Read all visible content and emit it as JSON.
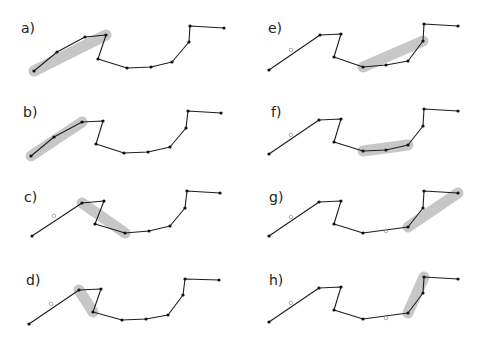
{
  "figure": {
    "width": 484,
    "height": 338,
    "highlight_color": "#c4c4c4",
    "line_color": "#1e1e1e",
    "panels": [
      {
        "label": "a)",
        "label_pos": [
          21,
          20
        ],
        "points": [
          [
            34,
            71
          ],
          [
            57,
            52
          ],
          [
            85,
            37
          ],
          [
            106,
            35
          ],
          [
            98,
            59
          ],
          [
            127,
            68
          ],
          [
            151,
            67
          ],
          [
            172,
            62
          ],
          [
            189,
            42
          ],
          [
            190,
            26
          ],
          [
            224,
            28
          ]
        ],
        "highlight": [
          [
            34,
            71
          ],
          [
            106,
            35
          ]
        ],
        "highlight_width": 11,
        "rings": []
      },
      {
        "label": "b)",
        "label_pos": [
          23,
          104
        ],
        "points": [
          [
            31,
            156
          ],
          [
            54,
            137
          ],
          [
            82,
            122
          ],
          [
            103,
            121
          ],
          [
            96,
            144
          ],
          [
            124,
            153
          ],
          [
            148,
            152
          ],
          [
            170,
            147
          ],
          [
            186,
            128
          ],
          [
            188,
            111
          ],
          [
            221,
            113
          ]
        ],
        "highlight": [
          [
            31,
            156
          ],
          [
            82,
            122
          ]
        ],
        "highlight_width": 11,
        "rings": []
      },
      {
        "label": "c)",
        "label_pos": [
          24,
          189
        ],
        "points": [
          [
            32,
            236
          ],
          [
            82,
            203
          ],
          [
            104,
            201
          ],
          [
            95,
            224
          ],
          [
            125,
            233
          ],
          [
            149,
            231
          ],
          [
            170,
            226
          ],
          [
            185,
            208
          ],
          [
            187,
            191
          ],
          [
            220,
            193
          ]
        ],
        "highlight": [
          [
            82,
            203
          ],
          [
            125,
            233
          ]
        ],
        "highlight_width": 11,
        "rings": [
          [
            54,
            216
          ]
        ]
      },
      {
        "label": "d)",
        "label_pos": [
          26,
          272
        ],
        "points": [
          [
            29,
            324
          ],
          [
            79,
            290
          ],
          [
            101,
            289
          ],
          [
            93,
            312
          ],
          [
            122,
            320
          ],
          [
            146,
            319
          ],
          [
            168,
            315
          ],
          [
            183,
            295
          ],
          [
            185,
            279
          ],
          [
            219,
            280
          ]
        ],
        "highlight": [
          [
            79,
            290
          ],
          [
            93,
            312
          ]
        ],
        "highlight_width": 11,
        "rings": [
          [
            51,
            304
          ]
        ]
      },
      {
        "label": "e)",
        "label_pos": [
          268,
          20
        ],
        "points": [
          [
            269,
            70
          ],
          [
            320,
            35
          ],
          [
            341,
            34
          ],
          [
            334,
            57
          ],
          [
            363,
            67
          ],
          [
            386,
            65
          ],
          [
            408,
            61
          ],
          [
            423,
            41
          ],
          [
            424,
            24
          ],
          [
            458,
            26
          ]
        ],
        "highlight": [
          [
            363,
            67
          ],
          [
            423,
            41
          ]
        ],
        "highlight_width": 11,
        "rings": [
          [
            291,
            50
          ]
        ]
      },
      {
        "label": "f)",
        "label_pos": [
          271,
          104
        ],
        "points": [
          [
            269,
            154
          ],
          [
            319,
            120
          ],
          [
            341,
            119
          ],
          [
            334,
            142
          ],
          [
            363,
            151
          ],
          [
            386,
            150
          ],
          [
            408,
            145
          ],
          [
            423,
            126
          ],
          [
            424,
            109
          ],
          [
            458,
            111
          ]
        ],
        "highlight": [
          [
            363,
            151
          ],
          [
            408,
            145
          ]
        ],
        "highlight_width": 11,
        "rings": [
          [
            291,
            135
          ]
        ]
      },
      {
        "label": "g)",
        "label_pos": [
          269,
          189
        ],
        "points": [
          [
            269,
            236
          ],
          [
            319,
            202
          ],
          [
            341,
            201
          ],
          [
            334,
            224
          ],
          [
            363,
            233
          ],
          [
            408,
            227
          ],
          [
            423,
            208
          ],
          [
            424,
            191
          ],
          [
            458,
            193
          ]
        ],
        "highlight": [
          [
            408,
            227
          ],
          [
            458,
            193
          ]
        ],
        "highlight_width": 11,
        "rings": [
          [
            291,
            217
          ],
          [
            386,
            231
          ]
        ]
      },
      {
        "label": "h)",
        "label_pos": [
          269,
          272
        ],
        "points": [
          [
            269,
            322
          ],
          [
            319,
            288
          ],
          [
            341,
            287
          ],
          [
            334,
            310
          ],
          [
            363,
            319
          ],
          [
            408,
            313
          ],
          [
            423,
            293
          ],
          [
            424,
            277
          ],
          [
            458,
            279
          ]
        ],
        "highlight": [
          [
            408,
            313
          ],
          [
            424,
            277
          ]
        ],
        "highlight_width": 11,
        "rings": [
          [
            291,
            303
          ],
          [
            386,
            318
          ]
        ]
      }
    ]
  }
}
